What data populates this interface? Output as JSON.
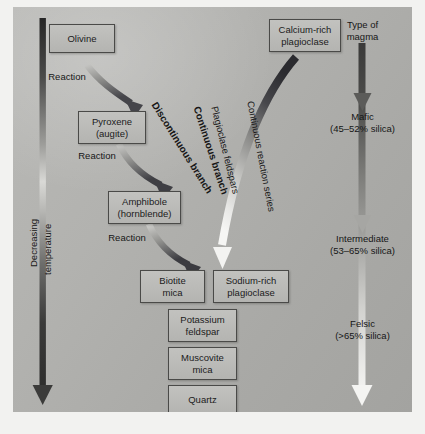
{
  "diagram": {
    "background_color": "#b0b0ad",
    "box_fill": "#bbbbb8",
    "box_border": "#4a4a48",
    "text_color": "#161616"
  },
  "temperature_axis": {
    "label_line1": "Decreasing",
    "label_line2": "temperature",
    "arrow_direction": "down",
    "arrow_color_top": "#2a2a2a",
    "arrow_color_mid": "#d8d8d5",
    "arrow_color_bottom": "#3a3a3a"
  },
  "discontinuous_branch": {
    "label": "Discontinuous branch",
    "reaction_label_1": "Reaction",
    "reaction_label_2": "Reaction",
    "reaction_label_3": "Reaction",
    "minerals": [
      {
        "name": "Olivine"
      },
      {
        "name": "Pyroxene\n(augite)"
      },
      {
        "name": "Amphibole\n(hornblende)"
      },
      {
        "name": "Biotite\nmica"
      }
    ]
  },
  "continuous_branch": {
    "label": "Continuous branch",
    "sublabel_1": "Plagioclase feldspars",
    "sublabel_2": "Continuous reaction series",
    "minerals": [
      {
        "name": "Calcium-rich\nplagioclase"
      },
      {
        "name": "Sodium-rich\nplagioclase"
      }
    ]
  },
  "late_minerals": [
    {
      "name": "Potassium\nfeldspar"
    },
    {
      "name": "Muscovite\nmica"
    },
    {
      "name": "Quartz"
    }
  ],
  "magma_column": {
    "header": "Type of\nmagma",
    "types": [
      {
        "name": "Mafic",
        "silica": "(45–52% silica)"
      },
      {
        "name": "Intermediate",
        "silica": "(53–65% silica)"
      },
      {
        "name": "Felsic",
        "silica": "(>65% silica)"
      }
    ],
    "arrow_direction": "down",
    "arrow_color_top": "#3c3c3c",
    "arrow_color_bottom": "#f2f2f0"
  }
}
